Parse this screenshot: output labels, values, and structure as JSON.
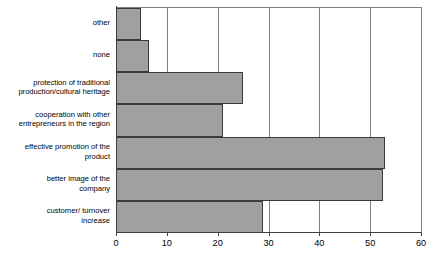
{
  "chart_data": {
    "type": "bar",
    "orientation": "horizontal",
    "title": "",
    "subtitle": "",
    "xlabel": "",
    "ylabel": "",
    "xlim": [
      0,
      60
    ],
    "ylim": null,
    "grid": true,
    "legend": null,
    "legend_position": "none",
    "xticks": [
      0,
      10,
      20,
      30,
      40,
      50,
      60
    ],
    "bar_color": "#a0a0a0",
    "bar_edge_color": "#3a3a3a",
    "axis_color": "#404040",
    "grid_color": "#808080",
    "background": "#ffffff",
    "categories": [
      "other",
      "none",
      "protection of traditional production/cultural heritage",
      "cooperation with other entrepreneurs in the region",
      "effective promotion of the product",
      "better image of the company",
      "customer/ turnover increase"
    ],
    "values": [
      5,
      6.5,
      25,
      21,
      53,
      52.5,
      29
    ],
    "series": [
      {
        "name": "",
        "values": [
          5,
          6.5,
          25,
          21,
          53,
          52.5,
          29
        ]
      }
    ]
  },
  "labels": {
    "rows": [
      {
        "lines": [
          "other"
        ]
      },
      {
        "lines": [
          "none"
        ]
      },
      {
        "lines": [
          "protection of traditional",
          "production/cultural heritage"
        ]
      },
      {
        "lines": [
          "cooperation with other",
          "entrepreneurs in the region"
        ]
      },
      {
        "lines": [
          "effective promotion of the",
          "product"
        ]
      },
      {
        "lines": [
          "better image of the",
          "company"
        ]
      },
      {
        "lines": [
          "customer/ turnover",
          "increase"
        ]
      }
    ]
  },
  "axis": {
    "x_tick_labels": [
      "0",
      "10",
      "20",
      "30",
      "40",
      "50",
      "60"
    ]
  }
}
